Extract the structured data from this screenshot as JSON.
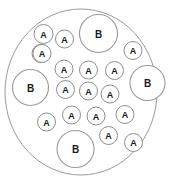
{
  "figure": {
    "background_color": "#ffffff",
    "outline_color": "#9a9a9a",
    "label_color": "#1a1a1a"
  },
  "container": {
    "name": "outer-boundary-circle",
    "cx": 81,
    "cy": 92,
    "rx": 76,
    "ry": 83
  },
  "legend_labels": {
    "small": "A",
    "large": "B"
  },
  "chart_data": {
    "type": "scatter",
    "xlabel": "",
    "ylabel": "",
    "counts": {
      "A": 17,
      "B": 4,
      "total": 21
    },
    "circles": [
      {
        "label": "B",
        "cx": 98.5,
        "cy": 33.5,
        "r": 19.0,
        "size": "large"
      },
      {
        "label": "B",
        "cx": 30.5,
        "cy": 87.5,
        "r": 18.0,
        "size": "large"
      },
      {
        "label": "B",
        "cx": 147.5,
        "cy": 83.0,
        "r": 17.5,
        "size": "large"
      },
      {
        "label": "B",
        "cx": 75.5,
        "cy": 149.0,
        "r": 18.5,
        "size": "large"
      },
      {
        "label": "A",
        "cx": 64.5,
        "cy": 39.0,
        "r": 9.0,
        "size": "small"
      },
      {
        "label": "A",
        "cx": 41.0,
        "cy": 53.5,
        "r": 9.0,
        "size": "small"
      },
      {
        "label": "A",
        "cx": 133.0,
        "cy": 50.5,
        "r": 9.0,
        "size": "small"
      },
      {
        "label": "A",
        "cx": 64.0,
        "cy": 69.0,
        "r": 9.0,
        "size": "small"
      },
      {
        "label": "A",
        "cx": 88.5,
        "cy": 70.0,
        "r": 9.0,
        "size": "small"
      },
      {
        "label": "A",
        "cx": 114.5,
        "cy": 70.5,
        "r": 9.0,
        "size": "small"
      },
      {
        "label": "A",
        "cx": 65.5,
        "cy": 89.5,
        "r": 9.0,
        "size": "small"
      },
      {
        "label": "A",
        "cx": 88.5,
        "cy": 91.0,
        "r": 9.0,
        "size": "small"
      },
      {
        "label": "A",
        "cx": 110.0,
        "cy": 94.0,
        "r": 9.0,
        "size": "small"
      },
      {
        "label": "A",
        "cx": 71.5,
        "cy": 115.0,
        "r": 9.0,
        "size": "small"
      },
      {
        "label": "A",
        "cx": 96.0,
        "cy": 116.0,
        "r": 9.0,
        "size": "small"
      },
      {
        "label": "A",
        "cx": 125.0,
        "cy": 114.5,
        "r": 9.0,
        "size": "small"
      },
      {
        "label": "A",
        "cx": 46.5,
        "cy": 122.0,
        "r": 9.0,
        "size": "small"
      },
      {
        "label": "A",
        "cx": 108.5,
        "cy": 135.5,
        "r": 9.0,
        "size": "small"
      },
      {
        "label": "A",
        "cx": 133.5,
        "cy": 142.5,
        "r": 9.0,
        "size": "small"
      },
      {
        "label": "A",
        "cx": 42.0,
        "cy": 53.5,
        "r": 9.0,
        "size": "small"
      },
      {
        "label": "A",
        "cx": 43.5,
        "cy": 34.0,
        "r": 9.5,
        "size": "small"
      }
    ]
  }
}
